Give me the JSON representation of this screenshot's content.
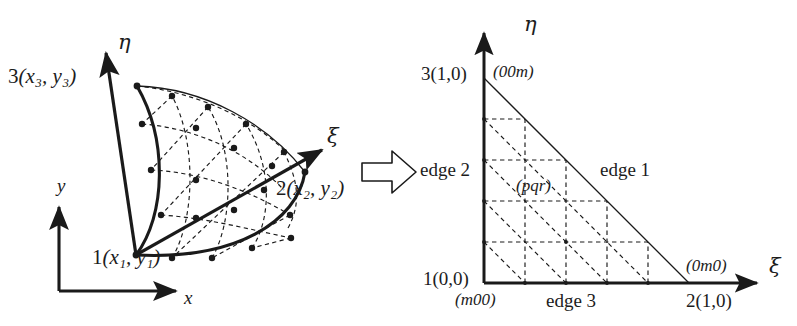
{
  "figure": {
    "caption": "",
    "background_color": "#ffffff",
    "line_color": "#1a1a1a"
  },
  "transform_arrow": {
    "icon": "right-block-arrow-icon",
    "direction": "right"
  },
  "physical_element": {
    "title": "",
    "global_axes": {
      "x_label": "x",
      "y_label": "y"
    },
    "local_axes": {
      "xi_label": "ξ",
      "eta_label": "η"
    },
    "vertices": [
      {
        "id": "1",
        "label_number": "1",
        "coords": "(x₁, y₁)"
      },
      {
        "id": "2",
        "label_number": "2",
        "coords": "(x₂, y₂)"
      },
      {
        "id": "3",
        "label_number": "3",
        "coords": "(x₃, y₃)"
      }
    ]
  },
  "reference_element": {
    "title": "",
    "axes": {
      "xi_label": "ξ",
      "eta_label": "η"
    },
    "vertices": [
      {
        "id": "1",
        "label": "1(0,0)",
        "barycentric": "(m00)"
      },
      {
        "id": "2",
        "label": "2(1,0)",
        "barycentric": "(0m0)"
      },
      {
        "id": "3",
        "label": "3(1,0)",
        "barycentric": "(00m)"
      }
    ],
    "edges": [
      {
        "id": "1",
        "label": "edge 1"
      },
      {
        "id": "2",
        "label": "edge 2"
      },
      {
        "id": "3",
        "label": "edge 3"
      }
    ],
    "interior_point_label": "(pqr)",
    "grid_divisions": 5
  }
}
